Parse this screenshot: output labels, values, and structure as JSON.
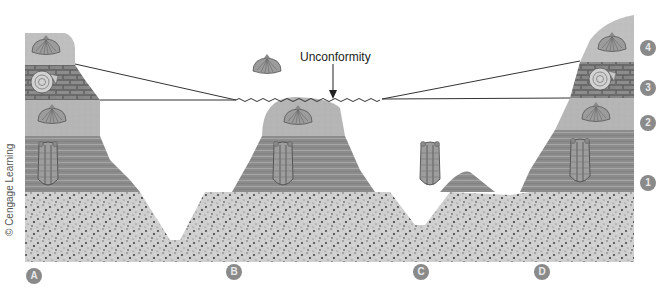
{
  "diagram": {
    "title": "Unconformity",
    "credit": "© Cengage Learning",
    "columns": [
      {
        "id": "A",
        "label": "A"
      },
      {
        "id": "B",
        "label": "B"
      },
      {
        "id": "C",
        "label": "C"
      },
      {
        "id": "D",
        "label": "D"
      }
    ],
    "layers": [
      {
        "id": "1",
        "label": "1",
        "rock": "horizontally striated layer",
        "fossil": "trilobite"
      },
      {
        "id": "2",
        "label": "2",
        "rock": "light fine-grained layer",
        "fossil": "brachiopod"
      },
      {
        "id": "3",
        "label": "3",
        "rock": "brick-patterned layer",
        "fossil": "ammonite"
      },
      {
        "id": "4",
        "label": "4",
        "rock": "light speckled top layer",
        "fossil": "brachiopod"
      }
    ],
    "basement": "speckled granular bedrock",
    "colors": {
      "bedrock_light": "#d6d6d6",
      "layer1": "#8e8e8e",
      "layer2": "#bdbdbd",
      "layer3": "#7a7a7a",
      "layer4": "#b3b3b3",
      "label_circle": "#8a8a8a",
      "line": "#333333"
    }
  }
}
